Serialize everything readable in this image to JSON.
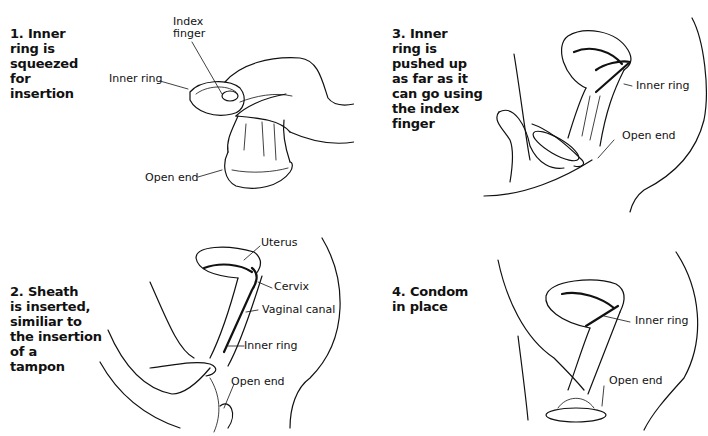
{
  "figure": {
    "type": "instructional-diagram",
    "steps": [
      {
        "number": 1,
        "caption": "1. Inner\nring is\nsqueezed\nfor\ninsertion",
        "labels": {
          "index_finger": "Index\nfinger",
          "inner_ring": "Inner ring",
          "open_end": "Open end"
        }
      },
      {
        "number": 2,
        "caption": "2. Sheath\nis inserted,\nsimiliar to\nthe insertion\nof a\ntampon",
        "labels": {
          "uterus": "Uterus",
          "cervix": "Cervix",
          "vaginal_canal": "Vaginal canal",
          "inner_ring": "Inner ring",
          "open_end": "Open end"
        }
      },
      {
        "number": 3,
        "caption": "3. Inner\nring is\npushed up\nas far as it\ncan go using\nthe index\nfinger",
        "labels": {
          "inner_ring": "Inner ring",
          "open_end": "Open end"
        }
      },
      {
        "number": 4,
        "caption": "4. Condom\nin place",
        "labels": {
          "inner_ring": "Inner ring",
          "open_end": "Open end"
        }
      }
    ],
    "colors": {
      "background": "#ffffff",
      "ink": "#111111"
    }
  }
}
